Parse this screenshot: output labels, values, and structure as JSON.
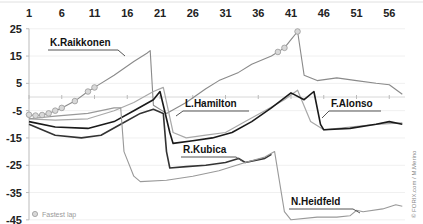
{
  "chart_data": {
    "type": "line",
    "title": "",
    "xlabel": "Lap",
    "ylabel": "Gap (s)",
    "x_ticks": [
      "1",
      "6",
      "11",
      "16",
      "21",
      "26",
      "31",
      "36",
      "41",
      "46",
      "51",
      "56"
    ],
    "y_ticks": [
      "25",
      "15",
      "5",
      "-5",
      "-15",
      "-25",
      "-35",
      "-45"
    ],
    "xlim": [
      1,
      58
    ],
    "ylim": [
      -45,
      25
    ],
    "x_axis_position": "top",
    "grid": "horizontal",
    "series": [
      {
        "name": "K.Raikkonen",
        "color": "#8a8a8a",
        "points": [
          [
            1,
            -6.5
          ],
          [
            2,
            -6.8
          ],
          [
            3,
            -6.6
          ],
          [
            4,
            -6
          ],
          [
            5,
            -5
          ],
          [
            6,
            -4
          ],
          [
            8,
            -1.5
          ],
          [
            10,
            2
          ],
          [
            11,
            3.5
          ],
          [
            14,
            8
          ],
          [
            17,
            13
          ],
          [
            19,
            16
          ],
          [
            19.5,
            17
          ],
          [
            20,
            -3
          ],
          [
            22,
            -6
          ],
          [
            25,
            -2
          ],
          [
            28,
            3
          ],
          [
            30,
            6
          ],
          [
            33,
            9
          ],
          [
            35,
            12
          ],
          [
            38,
            15
          ],
          [
            40,
            18
          ],
          [
            41,
            21
          ],
          [
            42,
            24
          ],
          [
            43,
            8
          ],
          [
            45,
            6
          ],
          [
            48,
            7
          ],
          [
            51,
            6
          ],
          [
            54,
            5
          ],
          [
            56,
            4.5
          ],
          [
            58,
            1
          ]
        ],
        "fastest_laps": [
          1,
          2,
          3,
          4,
          5,
          6,
          8,
          10,
          11,
          39,
          40,
          42
        ]
      },
      {
        "name": "L.Hamilton",
        "color": "#a8a8a8",
        "points": [
          [
            1,
            -8
          ],
          [
            5,
            -8.5
          ],
          [
            10,
            -8
          ],
          [
            14,
            -5
          ],
          [
            17,
            -2
          ],
          [
            20,
            2
          ],
          [
            21.5,
            3.5
          ],
          [
            23,
            -13
          ],
          [
            25,
            -15
          ],
          [
            28,
            -14
          ],
          [
            31,
            -13
          ],
          [
            34,
            -9
          ],
          [
            37,
            -5
          ],
          [
            40,
            -1
          ],
          [
            42,
            2.5
          ],
          [
            44,
            -9
          ],
          [
            46,
            -12
          ],
          [
            50,
            -11
          ],
          [
            54,
            -10
          ],
          [
            58,
            -9.5
          ]
        ]
      },
      {
        "name": "F.Alonso",
        "color": "#1a1a1a",
        "points": [
          [
            1,
            -9
          ],
          [
            5,
            -11
          ],
          [
            10,
            -11.5
          ],
          [
            14,
            -9
          ],
          [
            17,
            -5
          ],
          [
            20,
            -1
          ],
          [
            21,
            2
          ],
          [
            22.5,
            -13
          ],
          [
            23,
            -17
          ],
          [
            26,
            -16
          ],
          [
            29,
            -15
          ],
          [
            32,
            -13
          ],
          [
            35,
            -9
          ],
          [
            38,
            -4
          ],
          [
            41,
            1.5
          ],
          [
            43,
            -1
          ],
          [
            44.5,
            2
          ],
          [
            45.5,
            -10
          ],
          [
            46,
            -12
          ],
          [
            50,
            -11.5
          ],
          [
            54,
            -10
          ],
          [
            56,
            -9
          ],
          [
            58,
            -10
          ]
        ]
      },
      {
        "name": "R.Kubica",
        "color": "#333333",
        "points": [
          [
            1,
            -10
          ],
          [
            5,
            -14
          ],
          [
            9,
            -15
          ],
          [
            12,
            -14
          ],
          [
            15,
            -10
          ],
          [
            18,
            -6
          ],
          [
            20,
            -4.5
          ],
          [
            21.5,
            -6
          ],
          [
            22,
            -20
          ],
          [
            22.5,
            -26
          ],
          [
            25,
            -25.5
          ],
          [
            28,
            -25
          ],
          [
            31,
            -24
          ],
          [
            33,
            -22.5
          ],
          [
            34,
            -24
          ],
          [
            37,
            -22.5
          ],
          [
            38,
            -21
          ]
        ]
      },
      {
        "name": "N.Heidfeld",
        "color": "#999999",
        "points": [
          [
            1,
            -8
          ],
          [
            5,
            -7
          ],
          [
            10,
            -6
          ],
          [
            14,
            -4
          ],
          [
            15,
            -4
          ],
          [
            15.5,
            -20
          ],
          [
            17,
            -29
          ],
          [
            18,
            -31
          ],
          [
            22,
            -30.5
          ],
          [
            26,
            -29
          ],
          [
            30,
            -27
          ],
          [
            34,
            -24
          ],
          [
            37,
            -22
          ],
          [
            38.5,
            -20
          ],
          [
            40,
            -42
          ],
          [
            41,
            -45
          ],
          [
            45,
            -44
          ],
          [
            48,
            -44
          ],
          [
            50,
            -43.5
          ],
          [
            51,
            -41.5
          ],
          [
            52,
            -42
          ],
          [
            55,
            -41
          ],
          [
            57,
            -39.5
          ],
          [
            58,
            -40
          ]
        ]
      }
    ],
    "annotations": [
      {
        "text": "K.Raikkonen",
        "lap": 8,
        "y": 11
      },
      {
        "text": "L.Hamilton",
        "lap": 26,
        "y": -10
      },
      {
        "text": "R.Kubica",
        "lap": 25,
        "y": -21
      },
      {
        "text": "F.Alonso",
        "lap": 46,
        "y": -10
      },
      {
        "text": "N.Heidfeld",
        "lap": 41,
        "y": -40
      }
    ],
    "legend": {
      "position": "bottom-left",
      "entries": [
        "Fastest lap"
      ]
    }
  },
  "labels": {
    "raikkonen": "K.Raikkonen",
    "hamilton": "L.Hamilton",
    "kubica": "R.Kubica",
    "alonso": "F.Alonso",
    "heidfeld": "N.Heidfeld",
    "legend": "Fastest lap",
    "credit": "© FORIX.com / M.Merino"
  }
}
